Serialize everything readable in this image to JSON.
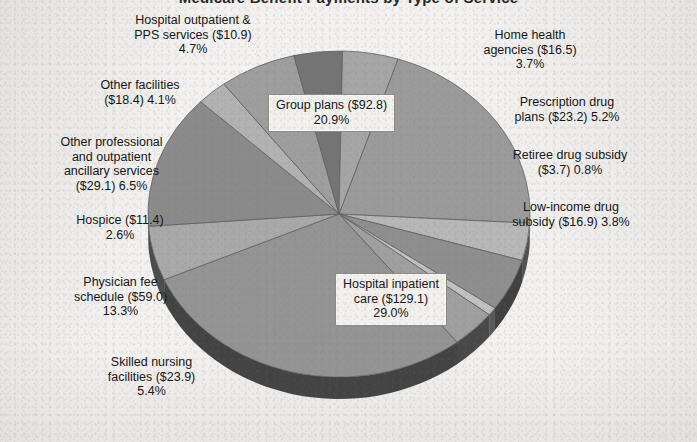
{
  "title_clipped": "Medicare Benefit Payments by Type of Service",
  "chart_data": {
    "type": "pie",
    "title": "Medicare Benefit Payments by Type of Service",
    "subtitle": "",
    "xlabel": "",
    "ylabel": "",
    "units": "Billions of dollars",
    "legend_position": "none",
    "grid": false,
    "labels_show_value_and_percent": true,
    "start_angle_deg": -72,
    "direction": "clockwise",
    "categories": [
      "Group plans",
      "Home health agencies",
      "Prescription drug plans",
      "Retiree drug subsidy",
      "Low-income drug subsidy",
      "Hospital inpatient care",
      "Skilled nursing facilities",
      "Physician fee schedule",
      "Hospice",
      "Other professional and outpatient ancillary services",
      "Other facilities",
      "Hospital outpatient & PPS services"
    ],
    "values": [
      92.8,
      16.5,
      23.2,
      3.7,
      16.9,
      129.1,
      23.9,
      59.0,
      11.4,
      29.1,
      18.4,
      10.9
    ],
    "percents": [
      20.9,
      3.7,
      5.2,
      0.8,
      3.8,
      29.0,
      5.4,
      13.3,
      2.6,
      6.5,
      4.1,
      4.7
    ],
    "slice_colors": [
      "#9b9b9b",
      "#b7b7b7",
      "#8f8f8f",
      "#c2c2c2",
      "#a0a0a0",
      "#949494",
      "#a9a9a9",
      "#8b8b8b",
      "#b2b2b2",
      "#9e9e9e",
      "#747474",
      "#a6a6a6"
    ],
    "total_value": 434.9,
    "total_percent": 100.0
  },
  "pie": {
    "center_x": 339,
    "center_y": 214,
    "radius_x": 191,
    "radius_y": 163,
    "depth": 22,
    "edge_color": "#3a3a3a",
    "outline_color": "#5f5f5f"
  },
  "callouts": [
    {
      "id": "group-plans",
      "line1": "Group plans ($92.8)",
      "line2": "20.9%",
      "line3": ""
    },
    {
      "id": "hospital-inpatient",
      "line1": "Hospital inpatient",
      "line2": "care ($129.1)",
      "line3": "29.0%"
    }
  ],
  "labels": {
    "hospital_outpatient": {
      "line1": "Hospital outpatient &",
      "line2": "PPS services ($10.9)",
      "line3": "4.7%"
    },
    "other_facilities": {
      "line1": "Other facilities",
      "line2": "($18.4) 4.1%",
      "line3": ""
    },
    "other_professional": {
      "line1": "Other professional",
      "line2": "and outpatient",
      "line3": "ancillary services",
      "line4": "($29.1) 6.5%"
    },
    "hospice": {
      "line1": "Hospice ($11.4)",
      "line2": "2.6%",
      "line3": ""
    },
    "physician_fee": {
      "line1": "Physician fee",
      "line2": "schedule ($59.0)",
      "line3": "13.3%"
    },
    "skilled_nursing": {
      "line1": "Skilled nursing",
      "line2": "facilities ($23.9)",
      "line3": "5.4%"
    },
    "home_health": {
      "line1": "Home health",
      "line2": "agencies ($16.5)",
      "line3": "3.7%"
    },
    "prescription_drug": {
      "line1": "Prescription drug",
      "line2": "plans ($23.2) 5.2%",
      "line3": ""
    },
    "retiree_drug": {
      "line1": "Retiree drug subsidy",
      "line2": "($3.7) 0.8%",
      "line3": ""
    },
    "low_income_drug": {
      "line1": "Low-income drug",
      "line2": "subsidy ($16.9) 3.8%",
      "line3": ""
    }
  },
  "colors": {
    "background": "#f3f2f0",
    "text": "#141414",
    "callout_bg": "#f2f1ee",
    "callout_border": "#8d8b86"
  }
}
